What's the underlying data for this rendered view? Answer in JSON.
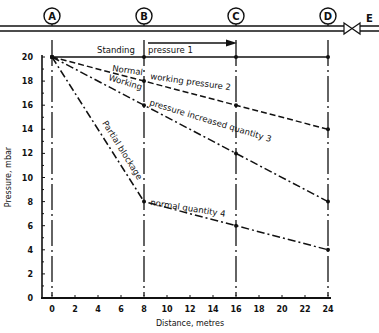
{
  "pipe": {
    "stations": [
      {
        "label": "A",
        "x_m": 0
      },
      {
        "label": "B",
        "x_m": 8
      },
      {
        "label": "C",
        "x_m": 16
      },
      {
        "label": "D",
        "x_m": 24
      }
    ],
    "end_label": "E",
    "valve": "gate-valve"
  },
  "chart_data": {
    "type": "line",
    "title": "",
    "xlabel": "Distance, metres",
    "ylabel": "Pressure, mbar",
    "xlim": [
      0,
      24
    ],
    "ylim": [
      0,
      20
    ],
    "xticks": [
      0,
      2,
      4,
      6,
      8,
      10,
      12,
      14,
      16,
      18,
      20,
      22,
      24
    ],
    "yticks": [
      0,
      2,
      4,
      6,
      8,
      10,
      12,
      14,
      16,
      18,
      20
    ],
    "grid": false,
    "series": [
      {
        "name": "Standing pressure 1",
        "x": [
          0,
          8,
          16,
          24
        ],
        "values": [
          20,
          20,
          20,
          20
        ],
        "style": "solid"
      },
      {
        "name": "Normal working pressure 2",
        "x": [
          0,
          8,
          16,
          24
        ],
        "values": [
          20,
          18,
          16,
          14
        ],
        "style": "dashed"
      },
      {
        "name": "Working pressure increased quantity 3",
        "x": [
          0,
          8,
          16,
          24
        ],
        "values": [
          20,
          16,
          12,
          8
        ],
        "style": "dash-dot"
      },
      {
        "name": "Partial blockage normal quantity 4",
        "x": [
          0,
          8,
          16,
          24
        ],
        "values": [
          20,
          8,
          6,
          4
        ],
        "style": "dash-dot"
      }
    ]
  },
  "labels": {
    "standing": "Standing",
    "pressure1": "pressure 1",
    "normal": "Normal",
    "working_pressure2": "working pressure 2",
    "working": "Working",
    "pressure_increased3": "pressure increased quantity 3",
    "partial_blockage": "Partial blockage",
    "normal_quantity4": "normal quantity 4"
  }
}
